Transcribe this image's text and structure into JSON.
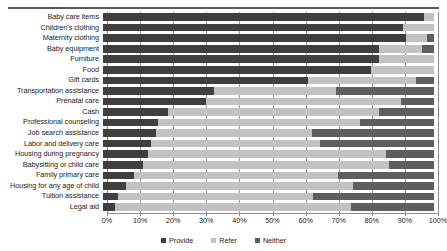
{
  "chart_data": {
    "type": "bar",
    "subtype": "stacked-horizontal-100",
    "title": "",
    "xlabel": "",
    "ylabel": "",
    "xlim": [
      0,
      100
    ],
    "xticks": [
      "0%",
      "10%",
      "20%",
      "30%",
      "40%",
      "50%",
      "60%",
      "70%",
      "80%",
      "90%",
      "100%"
    ],
    "grid": true,
    "legend_position": "bottom",
    "categories": [
      "Baby care items",
      "Children's clothing",
      "Maternity clothing",
      "Baby equipment",
      "Furniture",
      "Food",
      "Gift cards",
      "Transportation assistance",
      "Prenatal care",
      "Cash",
      "Professional counseling",
      "Job search assistance",
      "Labor and delivery care",
      "Housing during pregnancy",
      "Babysitting or child care",
      "Family primary care",
      "Housing for any age of child",
      "Tuition assistance",
      "Legal aid"
    ],
    "series": [
      {
        "name": "Provide",
        "color": "#3f3f3f",
        "values": [
          97,
          90.5,
          91.5,
          83.5,
          83.5,
          81,
          62,
          33.5,
          31,
          19.5,
          16.5,
          16,
          14.5,
          13.5,
          12,
          9.5,
          7,
          4.5,
          3.5
        ]
      },
      {
        "name": "Refer",
        "color": "#c2c2c2",
        "values": [
          3,
          9.5,
          6.5,
          13,
          16.5,
          19,
          32.5,
          37,
          59,
          64,
          61,
          47,
          51,
          72,
          74.5,
          61.5,
          68.5,
          59,
          71.5
        ]
      },
      {
        "name": "Neither",
        "color": "#5e5e5e",
        "values": [
          0,
          0,
          2,
          3.5,
          0,
          0,
          5.5,
          29.5,
          10,
          16.5,
          22.5,
          37,
          34.5,
          14.5,
          13.5,
          29,
          24.5,
          36.5,
          25
        ]
      }
    ]
  },
  "legend": {
    "items": [
      {
        "label": "Provide",
        "color": "#3f3f3f"
      },
      {
        "label": "Refer",
        "color": "#c2c2c2"
      },
      {
        "label": "Neither",
        "color": "#5e5e5e"
      }
    ]
  }
}
